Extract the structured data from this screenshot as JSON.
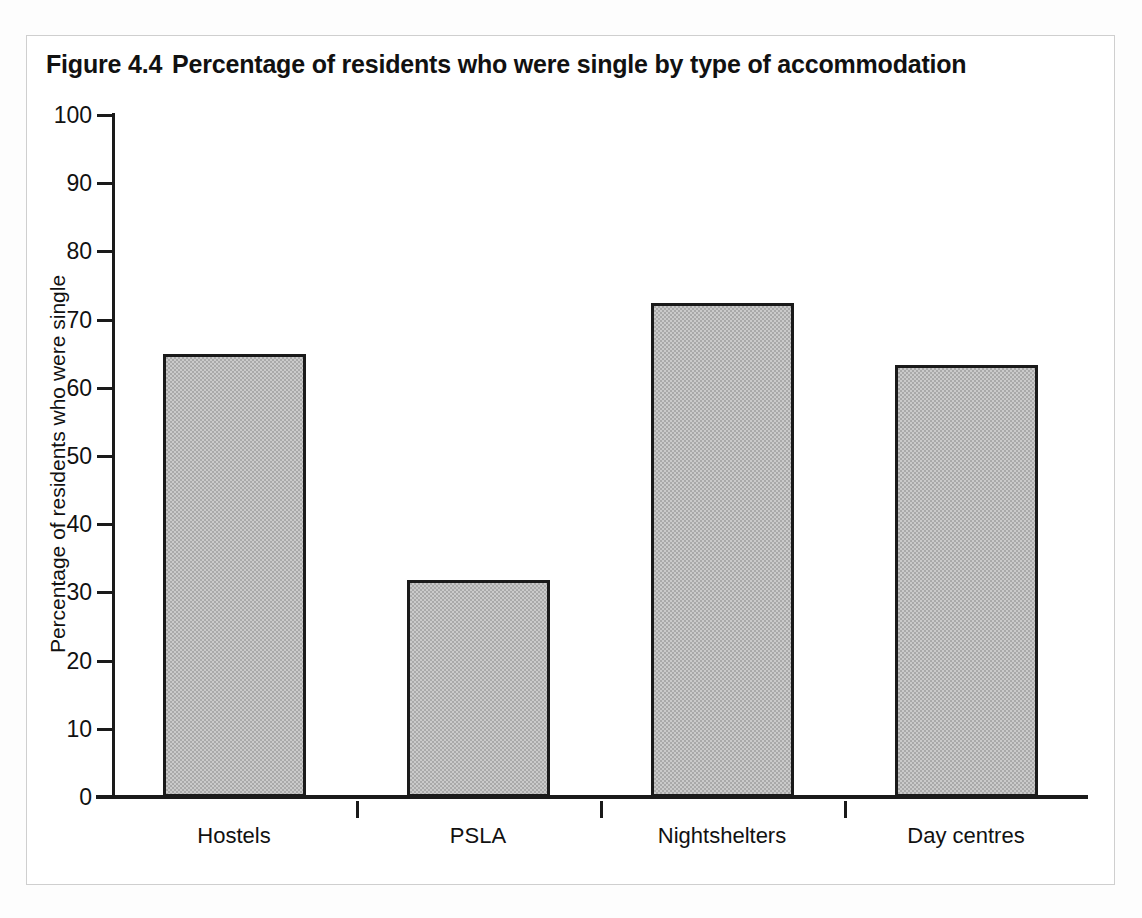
{
  "figure": {
    "number": "Figure 4.4",
    "title": "Percentage of residents who were single by type of accommodation"
  },
  "chart_data": {
    "type": "bar",
    "categories": [
      "Hostels",
      "PSLA",
      "Nightshelters",
      "Day centres"
    ],
    "values": [
      64.9,
      31.8,
      72.5,
      63.4
    ],
    "xlabel": "",
    "ylabel": "Percentage of residents who were single",
    "ylim": [
      0,
      100
    ],
    "ytick_labels": [
      "0",
      "10",
      "20",
      "30",
      "40",
      "50",
      "60",
      "70",
      "80",
      "90",
      "100"
    ],
    "ytick_values": [
      0,
      10,
      20,
      30,
      40,
      50,
      60,
      70,
      80,
      90,
      100
    ],
    "grid": false,
    "legend": "none",
    "bar_color": "#a9a9a9",
    "bar_edge_color": "#1a1a1a",
    "axis_color": "#1a1a1a",
    "background_color": "#ffffff"
  }
}
